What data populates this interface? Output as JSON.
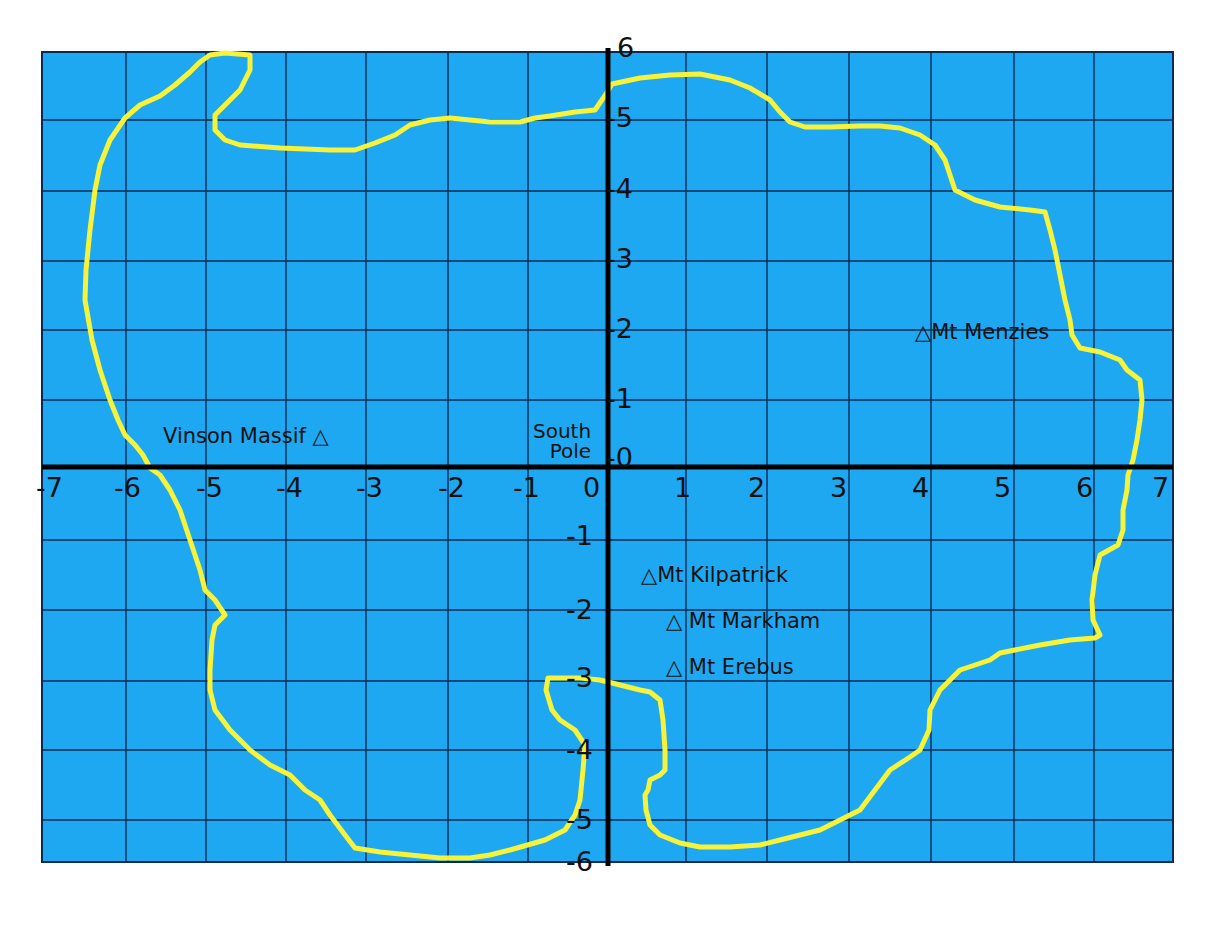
{
  "map": {
    "type": "coordinate-grid-map",
    "subject": "Antarctica coastline on coordinate grid",
    "colors": {
      "ocean": "#1ea8f2",
      "grid": "#0b2a52",
      "axis": "#000000",
      "coastline": "#f7f23a",
      "background": "#ffffff"
    },
    "x_axis": {
      "range": [
        -7,
        7
      ],
      "ticks": [
        "-7",
        "-6",
        "-5",
        "-4",
        "-3",
        "-2",
        "-1",
        "0",
        "1",
        "2",
        "3",
        "4",
        "5",
        "6",
        "7"
      ]
    },
    "y_axis": {
      "range": [
        -6,
        6
      ],
      "ticks_top_to_bottom": [
        "6",
        "-5",
        "-4",
        "-3",
        "-2",
        "-1",
        "-0",
        "-1",
        "-2",
        "-3",
        "-4",
        "-5",
        "-6"
      ],
      "tick_values": [
        6,
        5,
        4,
        3,
        2,
        1,
        0,
        -1,
        -2,
        -3,
        -4,
        -5,
        -6
      ]
    },
    "origin_label": {
      "line1": "South",
      "line2": "Pole"
    },
    "features": [
      {
        "name": "Vinson Massif",
        "label": "Vinson Massif",
        "symbol": "△",
        "x": -3.1,
        "y": 0.4,
        "symbol_side": "right"
      },
      {
        "name": "Mt Menzies",
        "label": "Mt Menzies",
        "symbol": "△",
        "x": 3.8,
        "y": 1.9,
        "symbol_side": "left"
      },
      {
        "name": "Mt Kilpatrick",
        "label": "Mt Kilpatrick",
        "symbol": "△",
        "x": 0.5,
        "y": -1.5,
        "symbol_side": "left"
      },
      {
        "name": "Mt Markham",
        "label": "Mt Markham",
        "symbol": "△",
        "x": 0.8,
        "y": -2.1,
        "symbol_side": "left"
      },
      {
        "name": "Mt Erebus",
        "label": "Mt Erebus",
        "symbol": "△",
        "x": 0.8,
        "y": -2.8,
        "symbol_side": "left"
      }
    ]
  }
}
